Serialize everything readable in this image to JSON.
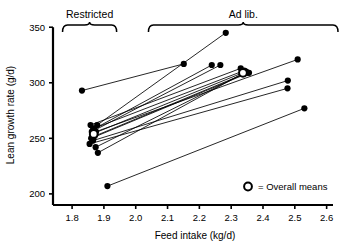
{
  "chart_data": {
    "type": "scatter",
    "title": "",
    "xlabel": "Feed intake (kg/d)",
    "ylabel": "Lean growth rate (g/d)",
    "xlim": [
      1.74,
      2.62
    ],
    "ylim": [
      190,
      352
    ],
    "xticks": [
      "1.8",
      "1.9",
      "2.0",
      "2.1",
      "2.2",
      "2.3",
      "2.4",
      "2.5",
      "2.6"
    ],
    "xtick_values": [
      1.8,
      1.9,
      2.0,
      2.1,
      2.2,
      2.3,
      2.4,
      2.5,
      2.6
    ],
    "yticks": [
      "200",
      "250",
      "300",
      "350"
    ],
    "ytick_values": [
      200,
      250,
      300,
      350
    ],
    "grid": false,
    "legend_position": "bottom-right",
    "legend": [
      {
        "marker": "open-circle",
        "label": "= Overall means"
      }
    ],
    "group_labels": [
      {
        "label": "Restricted",
        "brace_from": 1.77,
        "brace_to": 1.94
      },
      {
        "label": "Ad lib.",
        "brace_to": 2.62,
        "brace_from": 2.04
      }
    ],
    "series": [
      {
        "name": "paired observations",
        "note": "each line joins one animal's restricted-feeding point to its ad libitum point",
        "pairs": [
          {
            "restricted": [
              1.831,
              293
            ],
            "adlib": [
              2.151,
              317
            ]
          },
          {
            "restricted": [
              1.879,
              262
            ],
            "adlib": [
              2.283,
              345
            ]
          },
          {
            "restricted": [
              1.866,
              258
            ],
            "adlib": [
              2.239,
              316
            ]
          },
          {
            "restricted": [
              1.862,
              256
            ],
            "adlib": [
              2.266,
              316
            ]
          },
          {
            "restricted": [
              1.858,
              262
            ],
            "adlib": [
              2.33,
              313
            ]
          },
          {
            "restricted": [
              1.869,
              259
            ],
            "adlib": [
              2.341,
              311
            ]
          },
          {
            "restricted": [
              1.864,
              254
            ],
            "adlib": [
              2.345,
              310
            ]
          },
          {
            "restricted": [
              1.871,
              252
            ],
            "adlib": [
              2.35,
              309
            ]
          },
          {
            "restricted": [
              1.86,
              250
            ],
            "adlib": [
              2.356,
              309
            ]
          },
          {
            "restricted": [
              1.875,
              256
            ],
            "adlib": [
              2.509,
              321
            ]
          },
          {
            "restricted": [
              1.866,
              248
            ],
            "adlib": [
              2.478,
              302
            ]
          },
          {
            "restricted": [
              1.855,
              245
            ],
            "adlib": [
              2.477,
              295
            ]
          },
          {
            "restricted": [
              1.874,
              242
            ],
            "adlib": [
              2.338,
              308
            ]
          },
          {
            "restricted": [
              1.881,
              237
            ],
            "adlib": [
              2.347,
              310
            ]
          },
          {
            "restricted": [
              1.911,
              207
            ],
            "adlib": [
              2.53,
              277
            ]
          }
        ]
      },
      {
        "name": "overall means",
        "marker": "open-circle",
        "points": [
          [
            1.868,
            254
          ],
          [
            2.337,
            309
          ]
        ]
      }
    ]
  },
  "colors": {
    "ink": "#000000",
    "background": "#ffffff",
    "marker_fill": "#000000",
    "mean_fill": "#ffffff"
  }
}
